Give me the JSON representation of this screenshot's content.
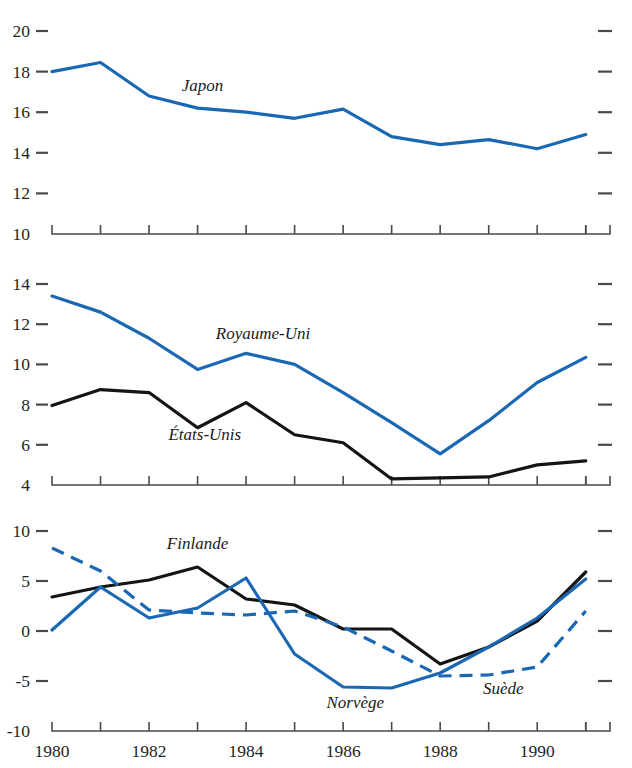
{
  "chart_data": [
    {
      "panel": "top",
      "type": "line",
      "title": "",
      "xlabel": "",
      "ylabel": "",
      "x": [
        1980,
        1981,
        1982,
        1983,
        1984,
        1985,
        1986,
        1987,
        1988,
        1989,
        1990,
        1991
      ],
      "xlim": [
        1980,
        1991.5
      ],
      "ylim": [
        10,
        20
      ],
      "yticks": [
        10,
        12,
        14,
        16,
        18,
        20
      ],
      "ytick_labels": [
        "10",
        "12",
        "14",
        "16",
        "18",
        "20"
      ],
      "xticks": [
        1980,
        1981,
        1982,
        1983,
        1984,
        1985,
        1986,
        1987,
        1988,
        1989,
        1990,
        1991
      ],
      "xtick_labels": [
        "1980",
        "",
        "1982",
        "",
        "1984",
        "",
        "1986",
        "",
        "1988",
        "",
        "1990",
        ""
      ],
      "grid": false,
      "right_axis_ticks": true,
      "series": [
        {
          "name": "Japon",
          "color": "#1a68b3",
          "style": "solid",
          "values": [
            18.0,
            18.45,
            16.8,
            16.2,
            16.0,
            15.7,
            16.15,
            14.8,
            14.4,
            14.65,
            14.2,
            14.9
          ],
          "label_x": 1983.1,
          "label_y": 17.05
        }
      ]
    },
    {
      "panel": "middle",
      "type": "line",
      "title": "",
      "xlabel": "",
      "ylabel": "",
      "x": [
        1980,
        1981,
        1982,
        1983,
        1984,
        1985,
        1986,
        1987,
        1988,
        1989,
        1990,
        1991
      ],
      "xlim": [
        1980,
        1991.5
      ],
      "ylim": [
        4,
        14
      ],
      "yticks": [
        4,
        6,
        8,
        10,
        12,
        14
      ],
      "ytick_labels": [
        "4",
        "6",
        "8",
        "10",
        "12",
        "14"
      ],
      "xticks": [
        1980,
        1981,
        1982,
        1983,
        1984,
        1985,
        1986,
        1987,
        1988,
        1989,
        1990,
        1991
      ],
      "xtick_labels": [
        "1980",
        "",
        "1982",
        "",
        "1984",
        "",
        "1986",
        "",
        "1988",
        "",
        "1990",
        ""
      ],
      "grid": false,
      "right_axis_ticks": true,
      "series": [
        {
          "name": "Royaume-Uni",
          "color": "#1a68b3",
          "style": "solid",
          "values": [
            13.4,
            12.6,
            11.3,
            9.75,
            10.55,
            10.0,
            8.6,
            7.1,
            5.55,
            7.2,
            9.1,
            10.35
          ],
          "label_x": 1984.35,
          "label_y": 11.25
        },
        {
          "name": "États-Unis",
          "color": "#141414",
          "style": "solid",
          "values": [
            7.95,
            8.75,
            8.6,
            6.85,
            8.1,
            6.5,
            6.1,
            4.3,
            4.35,
            4.4,
            5.0,
            5.2
          ],
          "label_x": 1983.15,
          "label_y": 6.25
        }
      ]
    },
    {
      "panel": "bottom",
      "type": "line",
      "title": "",
      "xlabel": "",
      "ylabel": "",
      "x": [
        1980,
        1981,
        1982,
        1983,
        1984,
        1985,
        1986,
        1987,
        1988,
        1989,
        1990,
        1991
      ],
      "xlim": [
        1980,
        1991.5
      ],
      "ylim": [
        -10,
        10
      ],
      "yticks": [
        -10,
        -5,
        0,
        5,
        10
      ],
      "ytick_labels": [
        "-10",
        "-5",
        "0",
        "5",
        "10"
      ],
      "xticks": [
        1980,
        1981,
        1982,
        1983,
        1984,
        1985,
        1986,
        1987,
        1988,
        1989,
        1990,
        1991
      ],
      "xtick_labels": [
        "1980",
        "",
        "1982",
        "",
        "1984",
        "",
        "1986",
        "",
        "1988",
        "",
        "1990",
        ""
      ],
      "grid": false,
      "right_axis_ticks": true,
      "series": [
        {
          "name": "Finlande",
          "color": "#141414",
          "style": "solid",
          "values": [
            3.4,
            4.4,
            5.1,
            6.4,
            3.2,
            2.6,
            0.2,
            0.2,
            -3.3,
            -1.6,
            1.0,
            5.9
          ],
          "label_x": 1983.0,
          "label_y": 8.2
        },
        {
          "name": "Norvège",
          "color": "#1a68b3",
          "style": "solid",
          "values": [
            0.1,
            4.4,
            1.3,
            2.3,
            5.3,
            -2.3,
            -5.6,
            -5.7,
            -4.2,
            -1.6,
            1.3,
            5.2
          ],
          "label_x": 1986.25,
          "label_y": -7.7
        },
        {
          "name": "Suède",
          "color": "#1a68b3",
          "style": "dashed",
          "values": [
            8.3,
            6.0,
            2.1,
            1.8,
            1.6,
            2.0,
            0.4,
            -2.0,
            -4.5,
            -4.4,
            -3.6,
            2.0
          ],
          "label_x": 1989.3,
          "label_y": -6.3
        }
      ]
    }
  ]
}
